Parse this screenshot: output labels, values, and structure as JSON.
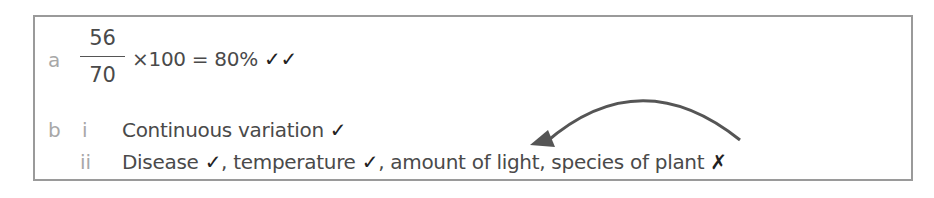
{
  "answer": {
    "part_a": {
      "label": "a",
      "numerator": "56",
      "denominator": "70",
      "expression": "×100 = 80%",
      "marks": "✓✓"
    },
    "part_b": {
      "label": "b",
      "items": [
        {
          "label": "i",
          "text": "Continuous variation",
          "mark": "✓"
        },
        {
          "label": "ii",
          "segments": [
            {
              "text": "Disease",
              "mark": "✓"
            },
            {
              "text": ", temperature",
              "mark": "✓"
            },
            {
              "text": ", amount of light, species of plant",
              "mark": "✗"
            }
          ]
        }
      ]
    },
    "annotation": {
      "type": "arrow",
      "color": "#555555"
    }
  }
}
